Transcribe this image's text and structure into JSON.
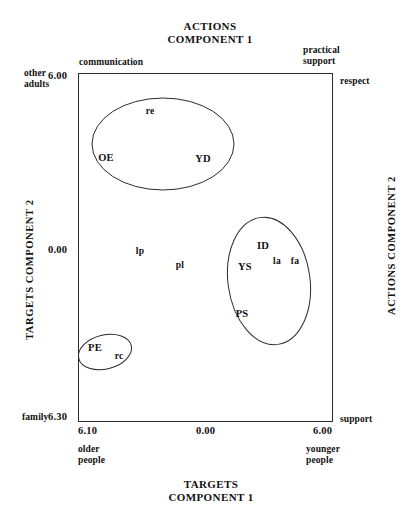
{
  "titles": {
    "top": "ACTIONS\nCOMPONENT 1",
    "bottom": "TARGETS\nCOMPONENT 1",
    "left": "TARGETS COMPONENT 2",
    "right": "ACTIONS COMPONENT 2"
  },
  "ticks": {
    "y_top": "6.00",
    "y_zero": "0.00",
    "y_bottom": "6.30",
    "x_left": "6.10",
    "x_zero": "0.00",
    "x_right": "6.00"
  },
  "anchors": {
    "top_left": "communication",
    "top_right": "practical\nsupport",
    "left_top": "other\nadults",
    "left_bottom": "family",
    "right_top": "respect",
    "right_bottom": "support",
    "bottom_left": "older\npeople",
    "bottom_right": "younger\npeople"
  },
  "chart_data": {
    "type": "scatter",
    "xlabel": "TARGETS COMPONENT 1",
    "ylabel": "TARGETS COMPONENT 2",
    "xlabel_secondary": "ACTIONS COMPONENT 1",
    "ylabel_secondary": "ACTIONS COMPONENT 2",
    "xlim": [
      -6.1,
      6.0
    ],
    "ylim": [
      -6.3,
      6.0
    ],
    "xticks": [
      "6.10",
      "0.00",
      "6.00"
    ],
    "yticks": [
      "6.00",
      "0.00",
      "6.30"
    ],
    "grid": false,
    "legend": "none",
    "axis_anchors": {
      "x_negative": "older people",
      "x_positive": "younger people",
      "y_positive": "other adults",
      "y_negative": "family",
      "top_axis_negative": "communication",
      "top_axis_positive": "practical support",
      "right_axis_positive": "respect",
      "right_axis_negative": "support"
    },
    "points": [
      {
        "label": "re",
        "case": "lower",
        "x": 150,
        "y": 111
      },
      {
        "label": "OE",
        "case": "upper",
        "x": 106,
        "y": 157
      },
      {
        "label": "YD",
        "case": "upper",
        "x": 203,
        "y": 158
      },
      {
        "label": "lp",
        "case": "lower",
        "x": 140,
        "y": 251
      },
      {
        "label": "pl",
        "case": "lower",
        "x": 180,
        "y": 265
      },
      {
        "label": "ID",
        "case": "upper",
        "x": 263,
        "y": 245
      },
      {
        "label": "la",
        "case": "lower",
        "x": 277,
        "y": 261
      },
      {
        "label": "fa",
        "case": "lower",
        "x": 295,
        "y": 261
      },
      {
        "label": "YS",
        "case": "upper",
        "x": 245,
        "y": 266
      },
      {
        "label": "PS",
        "case": "upper",
        "x": 242,
        "y": 313
      },
      {
        "label": "PE",
        "case": "upper",
        "x": 95,
        "y": 347
      },
      {
        "label": "rc",
        "case": "lower",
        "x": 119,
        "y": 356
      }
    ],
    "clusters": [
      {
        "name": "upper-left-cluster",
        "cx": 163,
        "cy": 144,
        "rx": 71,
        "ry": 46,
        "rotation": 0,
        "members": [
          "re",
          "OE",
          "YD"
        ]
      },
      {
        "name": "right-cluster",
        "cx": 269,
        "cy": 281,
        "rx": 41,
        "ry": 64,
        "rotation": -8,
        "members": [
          "ID",
          "la",
          "fa",
          "YS",
          "PS"
        ]
      },
      {
        "name": "lower-left-cluster",
        "cx": 105,
        "cy": 352,
        "rx": 27,
        "ry": 17,
        "rotation": -14,
        "members": [
          "PE",
          "rc"
        ]
      }
    ]
  }
}
